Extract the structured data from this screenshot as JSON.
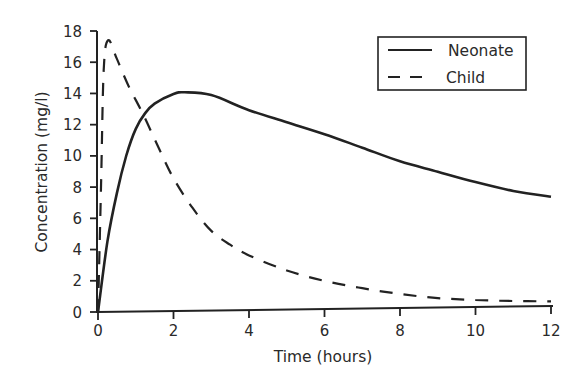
{
  "chart_data": {
    "type": "line",
    "title": "",
    "xlabel": "Time (hours)",
    "ylabel": "Concentration (mg/l)",
    "xlim": [
      0,
      12
    ],
    "ylim": [
      0,
      18
    ],
    "xticks": [
      0,
      2,
      4,
      6,
      8,
      10,
      12
    ],
    "yticks": [
      0,
      2,
      4,
      6,
      8,
      10,
      12,
      14,
      16,
      18
    ],
    "grid": false,
    "legend_position": "upper right",
    "series": [
      {
        "name": "Neonate",
        "style": "solid",
        "x": [
          0,
          0.25,
          0.5,
          0.75,
          1.0,
          1.25,
          1.5,
          2.0,
          2.3,
          3.0,
          4.0,
          5.0,
          6.0,
          7.0,
          8.0,
          9.0,
          10.0,
          11.0,
          12.0
        ],
        "y": [
          0,
          4.5,
          7.6,
          10.0,
          11.7,
          12.7,
          13.3,
          13.9,
          14.0,
          13.8,
          12.8,
          12.0,
          11.2,
          10.3,
          9.4,
          8.7,
          8.0,
          7.4,
          7.0
        ]
      },
      {
        "name": "Child",
        "style": "dashed",
        "x": [
          0,
          0.08,
          0.15,
          0.27,
          0.5,
          0.8,
          1.2,
          1.6,
          2.0,
          2.5,
          3.0,
          3.5,
          4.0,
          5.0,
          6.0,
          7.0,
          8.0,
          9.0,
          10.0,
          11.0,
          12.0
        ],
        "y": [
          0,
          8.0,
          15.5,
          17.4,
          16.2,
          14.5,
          12.6,
          10.5,
          8.5,
          6.6,
          5.1,
          4.2,
          3.5,
          2.5,
          1.8,
          1.3,
          0.9,
          0.6,
          0.45,
          0.35,
          0.3
        ]
      }
    ]
  },
  "axes": {
    "x_title": "Time (hours)",
    "y_title": "Concentration (mg/l)",
    "x_tick_labels": [
      "0",
      "2",
      "4",
      "6",
      "8",
      "10",
      "12"
    ],
    "y_tick_labels": [
      "0",
      "2",
      "4",
      "6",
      "8",
      "10",
      "12",
      "14",
      "16",
      "18"
    ]
  },
  "legend": {
    "items": [
      {
        "label": "Neonate",
        "style": "solid"
      },
      {
        "label": "Child",
        "style": "dashed"
      }
    ]
  },
  "colors": {
    "line": "#222222",
    "axis": "#222222",
    "text": "#2a2a2a",
    "background": "#ffffff"
  }
}
